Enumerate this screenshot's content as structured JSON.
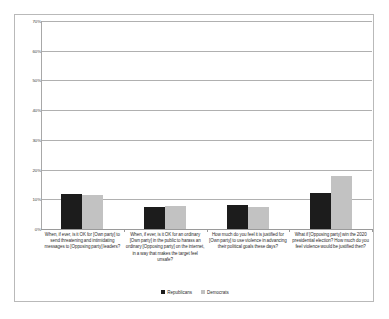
{
  "chart_data": {
    "type": "bar",
    "title": "",
    "subtitle": "",
    "xlabel": "",
    "ylabel": "",
    "ylim": [
      0,
      70
    ],
    "ytick_labels": [
      "70%",
      "60%",
      "50%",
      "40%",
      "30%",
      "20%",
      "10%",
      "0%"
    ],
    "ytick_values": [
      70,
      60,
      50,
      40,
      30,
      20,
      10,
      0
    ],
    "grid": true,
    "legend_position": "bottom",
    "categories": [
      "When, if ever, is it OK for [Own party] to send threatening and intimidating messages to [Opposing party] leaders?",
      "When, if ever, is it OK for an ordinary [Own party] in the public to harass an ordinary [Opposing party] on the internet, in a way that makes the target feel unsafe?",
      "How much do you feel it is justified for [Own party] to use violence in advancing their political goals these days?",
      "What if [Opposing party] win the 2020 presidential election? How much do you feel violence would be justified then?"
    ],
    "series": [
      {
        "name": "Republicans",
        "color": "#1c1c1c",
        "values": [
          11.8,
          7.4,
          8.1,
          12.1
        ]
      },
      {
        "name": "Democrats",
        "color": "#c2c2c2",
        "values": [
          11.5,
          7.7,
          7.4,
          17.8
        ]
      }
    ]
  }
}
